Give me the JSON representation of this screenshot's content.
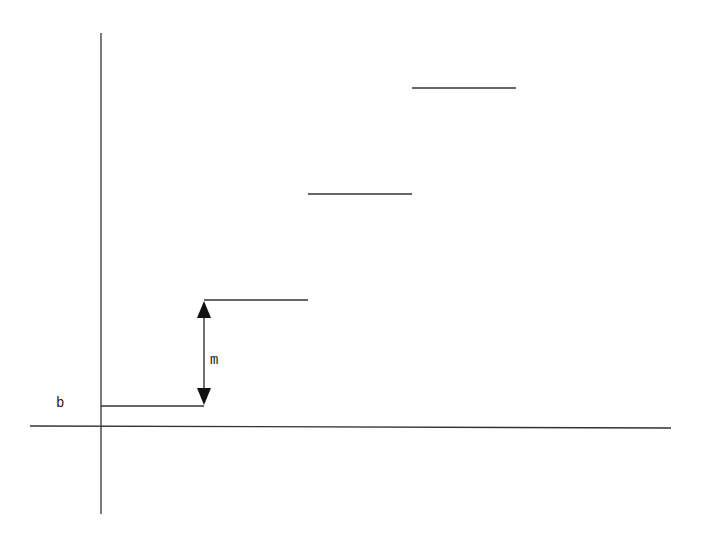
{
  "diagram": {
    "type": "step-function",
    "labels": {
      "intercept": "b",
      "step_height": "m"
    },
    "colors": {
      "line": "#333333",
      "background": "#ffffff"
    },
    "axes": {
      "y_axis": {
        "x": 101,
        "y1": 33,
        "y2": 514
      },
      "x_axis": {
        "x1": 30,
        "y1": 426,
        "x2": 671,
        "y2": 428
      }
    },
    "steps": [
      {
        "x1": 101,
        "x2": 204,
        "y": 406
      },
      {
        "x1": 204,
        "x2": 308,
        "y": 300
      },
      {
        "x1": 308,
        "x2": 412,
        "y": 194
      },
      {
        "x1": 412,
        "x2": 516,
        "y": 88
      }
    ],
    "arrow": {
      "x": 204,
      "y_top": 300,
      "y_bottom": 406
    }
  }
}
